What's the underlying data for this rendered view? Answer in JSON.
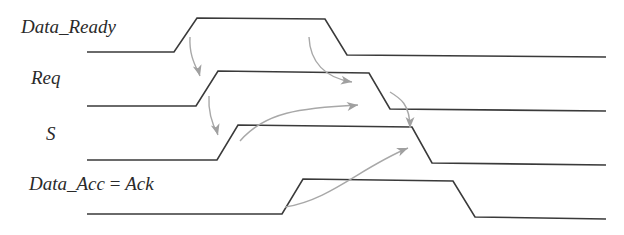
{
  "diagram": {
    "colors": {
      "waveform": "#3a3a3a",
      "arrow": "#a8a8a8",
      "label": "#2a2a2a",
      "background": "#ffffff"
    },
    "signals": [
      {
        "name": "Data_Ready",
        "label": "Data_Ready",
        "label_x": 21,
        "label_y": 33,
        "points": [
          [
            87,
            52
          ],
          [
            174,
            52
          ],
          [
            197,
            18
          ],
          [
            325,
            19
          ],
          [
            347,
            55
          ],
          [
            606,
            57
          ]
        ]
      },
      {
        "name": "Req",
        "label": "Req",
        "label_x": 31,
        "label_y": 84,
        "points": [
          [
            87,
            106
          ],
          [
            196,
            106
          ],
          [
            218,
            71
          ],
          [
            369,
            73
          ],
          [
            390,
            109
          ],
          [
            606,
            111
          ]
        ]
      },
      {
        "name": "S",
        "label": "S",
        "label_x": 46,
        "label_y": 140,
        "points": [
          [
            87,
            160
          ],
          [
            217,
            160
          ],
          [
            238,
            125
          ],
          [
            412,
            127
          ],
          [
            432,
            163
          ],
          [
            606,
            165
          ]
        ]
      },
      {
        "name": "Data_Acc",
        "label_parts": [
          "Data_Acc",
          " = ",
          "Ack"
        ],
        "label_x": 29,
        "label_y": 190,
        "points": [
          [
            87,
            214
          ],
          [
            282,
            214
          ],
          [
            303,
            179
          ],
          [
            453,
            181
          ],
          [
            475,
            217
          ],
          [
            606,
            219
          ]
        ]
      }
    ],
    "causal_arrows": [
      {
        "from": "Data_Ready rise",
        "to": "Req rise",
        "path": "M190,37 C189,55 195,65 200,76",
        "head": [
          200,
          76
        ],
        "angle": 75
      },
      {
        "from": "Req rise",
        "to": "S rise",
        "path": "M209,96 C208,112 212,124 218,135",
        "head": [
          218,
          135
        ],
        "angle": 75
      },
      {
        "from": "Data_Ready fall",
        "to": "Req fall",
        "path": "M309,37 C310,62 325,78 352,82",
        "head": [
          352,
          82
        ],
        "angle": 10
      },
      {
        "from": "S rise",
        "to": "Req fall",
        "path": "M240,141 C265,112 300,108 358,105",
        "head": [
          358,
          105
        ],
        "angle": -8
      },
      {
        "from": "Req fall",
        "to": "S fall",
        "path": "M390,92 C400,98 410,104 410,128",
        "head": [
          410,
          128
        ],
        "angle": 90
      },
      {
        "from": "Data_Acc rise",
        "to": "S fall",
        "path": "M285,207 C330,200 360,168 408,148",
        "head": [
          408,
          148
        ],
        "angle": -22
      }
    ]
  }
}
